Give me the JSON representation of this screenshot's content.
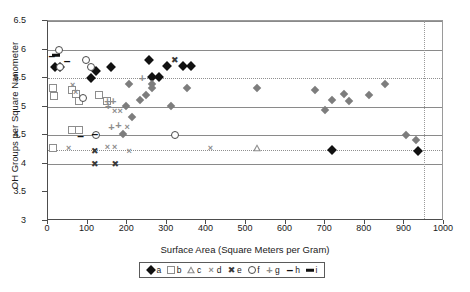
{
  "chart_data": {
    "type": "scatter",
    "title": "",
    "xlabel": "Surface Area (Square Meters per Gram)",
    "ylabel": "OH Groups per Square Nanometer",
    "xlim": [
      0,
      1000
    ],
    "ylim": [
      3,
      6.5
    ],
    "xticks": [
      0,
      100,
      200,
      300,
      400,
      500,
      600,
      700,
      800,
      900,
      1000
    ],
    "yticks": [
      3,
      3.5,
      4,
      4.5,
      5,
      5.5,
      6,
      6.5
    ],
    "grid": "horizontal gridlines at 4, 4.5, 5, 6, 6.5; dotted reference line at 4.25 and 5.5; dotted vertical reference line at 950",
    "reference_lines": {
      "horizontal_dotted": [
        5.5,
        4.25
      ],
      "vertical_dotted": [
        950
      ]
    },
    "legend_position": "below-axis-center",
    "series": [
      {
        "name": "a",
        "marker": "filled-diamond",
        "color": "#111111",
        "points": [
          [
            18,
            5.7
          ],
          [
            30,
            5.7
          ],
          [
            108,
            5.5
          ],
          [
            120,
            5.62
          ],
          [
            158,
            5.7
          ],
          [
            255,
            5.82
          ],
          [
            262,
            5.52
          ],
          [
            280,
            5.52
          ],
          [
            300,
            5.72
          ],
          [
            340,
            5.72
          ],
          [
            360,
            5.72
          ],
          [
            718,
            4.25
          ],
          [
            935,
            4.22
          ]
        ]
      },
      {
        "name": "b",
        "marker": "open-square",
        "color": "#8d8d8d",
        "points": [
          [
            12,
            5.32
          ],
          [
            14,
            5.18
          ],
          [
            60,
            5.3
          ],
          [
            70,
            5.22
          ],
          [
            78,
            5.1
          ],
          [
            128,
            5.2
          ],
          [
            150,
            5.1
          ],
          [
            60,
            4.6
          ],
          [
            78,
            4.6
          ],
          [
            12,
            4.28
          ]
        ]
      },
      {
        "name": "c",
        "marker": "open-triangle",
        "color": "#8d8d8d",
        "points": [
          [
            528,
            4.28
          ]
        ]
      },
      {
        "name": "d",
        "marker": "x-light",
        "color": "#8d8d8d",
        "points": [
          [
            62,
            5.38
          ],
          [
            70,
            5.26
          ],
          [
            168,
            4.92
          ],
          [
            182,
            4.92
          ],
          [
            200,
            4.65
          ],
          [
            52,
            4.28
          ],
          [
            150,
            4.3
          ],
          [
            168,
            4.3
          ],
          [
            205,
            4.22
          ],
          [
            410,
            4.28
          ]
        ]
      },
      {
        "name": "e",
        "marker": "x-bold",
        "color": "#3a3a3a",
        "points": [
          [
            118,
            4.0
          ],
          [
            170,
            4.0
          ],
          [
            118,
            4.23
          ],
          [
            320,
            5.82
          ]
        ]
      },
      {
        "name": "f",
        "marker": "open-circle",
        "color": "#4a4a4a",
        "points": [
          [
            28,
            6.0
          ],
          [
            30,
            5.7
          ],
          [
            95,
            5.82
          ],
          [
            108,
            5.7
          ],
          [
            88,
            5.15
          ],
          [
            120,
            4.5
          ],
          [
            320,
            4.5
          ]
        ]
      },
      {
        "name": "g",
        "marker": "plus",
        "color": "#8d8d8d",
        "points": [
          [
            150,
            5.1
          ],
          [
            165,
            5.1
          ],
          [
            152,
            5.02
          ],
          [
            178,
            4.68
          ],
          [
            160,
            4.65
          ],
          [
            238,
            5.5
          ]
        ]
      },
      {
        "name": "h",
        "marker": "dash",
        "color": "#111111",
        "points": [
          [
            10,
            5.88
          ],
          [
            48,
            5.8
          ],
          [
            82,
            4.48
          ],
          [
            118,
            4.52
          ]
        ]
      },
      {
        "name": "i",
        "marker": "bar",
        "color": "#111111",
        "points": [
          [
            20,
            5.9
          ]
        ]
      },
      {
        "name": "small-diamond-cluster",
        "marker": "small-filled-diamond",
        "color": "#7d7d7d",
        "points": [
          [
            205,
            5.4
          ],
          [
            262,
            5.4
          ],
          [
            232,
            5.12
          ],
          [
            248,
            5.2
          ],
          [
            262,
            5.32
          ],
          [
            212,
            4.82
          ],
          [
            310,
            5.02
          ],
          [
            350,
            5.32
          ],
          [
            528,
            5.32
          ],
          [
            675,
            5.3
          ],
          [
            700,
            4.95
          ],
          [
            718,
            5.12
          ],
          [
            748,
            5.22
          ],
          [
            760,
            5.1
          ],
          [
            810,
            5.2
          ],
          [
            850,
            5.4
          ],
          [
            905,
            4.5
          ],
          [
            930,
            4.42
          ],
          [
            198,
            5.02
          ],
          [
            190,
            4.52
          ]
        ]
      }
    ]
  },
  "legend": {
    "items": [
      {
        "symbol": "filled-diamond",
        "label": "a"
      },
      {
        "symbol": "open-square",
        "label": "b"
      },
      {
        "symbol": "open-triangle",
        "label": "c"
      },
      {
        "symbol": "x-light",
        "label": "d"
      },
      {
        "symbol": "x-bold",
        "label": "e"
      },
      {
        "symbol": "open-circle",
        "label": "f"
      },
      {
        "symbol": "plus",
        "label": "g"
      },
      {
        "symbol": "dash",
        "label": "h"
      },
      {
        "symbol": "bar",
        "label": "i"
      }
    ]
  }
}
